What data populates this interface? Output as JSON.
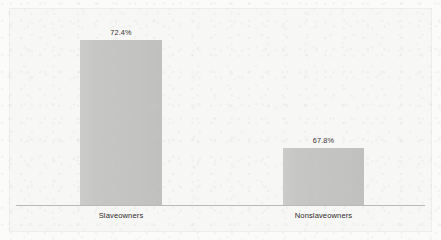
{
  "chart_data": {
    "type": "bar",
    "title": "",
    "subtitle": "",
    "xlabel": "",
    "ylabel": "",
    "categories": [
      "Slaveowners",
      "Nonslaveowners"
    ],
    "values": [
      72.4,
      67.8
    ],
    "value_labels": [
      "72.4%",
      "67.8%"
    ],
    "unit": "%",
    "grid": false,
    "legend": false,
    "legend_position": "none",
    "y_axis_visible": false,
    "y_tick_labels": [],
    "x_tick_labels": [
      "Slaveowners",
      "Nonslaveowners"
    ],
    "annotations": [],
    "note": "Bar heights are drawn on a truncated (non-zero) baseline, so pixel heights are not proportional to the values.",
    "bars": [
      {
        "category": "Slaveowners",
        "value": 72.4,
        "label": "72.4%",
        "color": "#c6c6c4",
        "left_px": 80,
        "top_px": 40,
        "width_px": 82,
        "height_px": 165
      },
      {
        "category": "Nonslaveowners",
        "value": 67.8,
        "label": "67.8%",
        "color": "#c6c6c4",
        "left_px": 283,
        "top_px": 148,
        "width_px": 81,
        "height_px": 57
      }
    ]
  },
  "style": {
    "bar_color": "#c6c6c4",
    "background_color": "#f7f7f6",
    "axis_color": "#b9b9b7",
    "frame_color": "#eeeeec",
    "label_color": "#2e2b29"
  }
}
